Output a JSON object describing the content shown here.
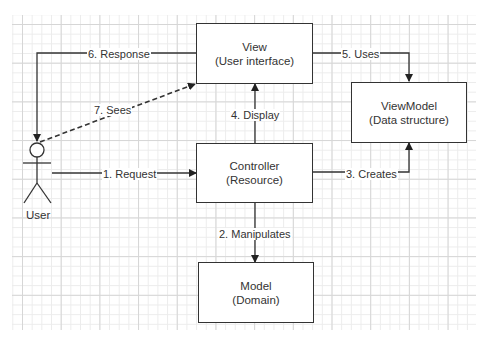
{
  "diagram": {
    "type": "MVC with ViewModel flow",
    "actor": {
      "label": "User"
    },
    "nodes": {
      "view": {
        "title": "View",
        "subtitle": "(User interface)"
      },
      "viewmodel": {
        "title": "ViewModel",
        "subtitle": "(Data structure)"
      },
      "controller": {
        "title": "Controller",
        "subtitle": "(Resource)"
      },
      "model": {
        "title": "Model",
        "subtitle": "(Domain)"
      }
    },
    "edges": [
      {
        "id": "e1",
        "from": "User",
        "to": "Controller",
        "label": "1. Request",
        "style": "solid"
      },
      {
        "id": "e2",
        "from": "Controller",
        "to": "Model",
        "label": "2. Manipulates",
        "style": "solid"
      },
      {
        "id": "e3",
        "from": "Controller",
        "to": "ViewModel",
        "label": "3. Creates",
        "style": "solid"
      },
      {
        "id": "e4",
        "from": "Controller",
        "to": "View",
        "label": "4. Display",
        "style": "solid"
      },
      {
        "id": "e5",
        "from": "View",
        "to": "ViewModel",
        "label": "5. Uses",
        "style": "solid"
      },
      {
        "id": "e6",
        "from": "View",
        "to": "User",
        "label": "6. Response",
        "style": "solid"
      },
      {
        "id": "e7",
        "from": "User",
        "to": "View",
        "label": "7. Sees",
        "style": "dashed"
      }
    ],
    "colors": {
      "stroke": "#333333",
      "grid_major": "#d6d6d6",
      "grid_minor": "#ececec",
      "background": "#ffffff"
    }
  }
}
